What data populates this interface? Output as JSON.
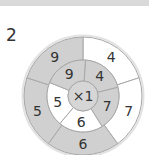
{
  "question_number": "2",
  "center_label": "×1",
  "colors": {
    "shaded": "#d0d0d0",
    "white": "#ffffff",
    "stroke": "#a8a8a8",
    "center": "#d6d6d6"
  },
  "outer_ring": [
    {
      "value": "4",
      "shaded": false
    },
    {
      "value": "7",
      "shaded": false
    },
    {
      "value": "6",
      "shaded": true
    },
    {
      "value": "5",
      "shaded": true
    },
    {
      "value": "9",
      "shaded": true
    }
  ],
  "inner_ring": [
    {
      "value": "4",
      "shaded": true
    },
    {
      "value": "7",
      "shaded": true
    },
    {
      "value": "6",
      "shaded": false
    },
    {
      "value": "5",
      "shaded": false
    },
    {
      "value": "9",
      "shaded": true
    }
  ]
}
